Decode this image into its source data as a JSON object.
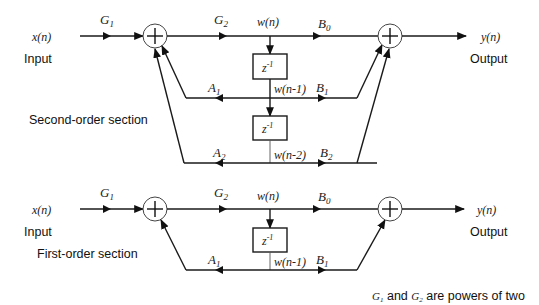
{
  "diagram": {
    "second_order": {
      "section_label": "Second-order section",
      "input_signal": "x(n)",
      "input_label": "Input",
      "output_signal": "y(n)",
      "output_label": "Output",
      "gains": {
        "g1": "G",
        "g1_sub": "1",
        "g2": "G",
        "g2_sub": "2"
      },
      "nodes": {
        "w0": "w(n)",
        "w1": "w(n-1)",
        "w2": "w(n-2)"
      },
      "delays": [
        {
          "base": "z",
          "exp": "-1"
        },
        {
          "base": "z",
          "exp": "-1"
        }
      ],
      "feedback": [
        {
          "name": "A",
          "sub": "1"
        },
        {
          "name": "A",
          "sub": "2"
        }
      ],
      "feedforward": [
        {
          "name": "B",
          "sub": "0"
        },
        {
          "name": "B",
          "sub": "1"
        },
        {
          "name": "B",
          "sub": "2"
        }
      ],
      "summers": [
        "+",
        "+"
      ]
    },
    "first_order": {
      "section_label": "First-order section",
      "input_signal": "x(n)",
      "input_label": "Input",
      "output_signal": "y(n)",
      "output_label": "Output",
      "gains": {
        "g1": "G",
        "g1_sub": "1",
        "g2": "G",
        "g2_sub": "2"
      },
      "nodes": {
        "w0": "w(n)",
        "w1": "w(n-1)"
      },
      "delays": [
        {
          "base": "z",
          "exp": "-1"
        }
      ],
      "feedback": [
        {
          "name": "A",
          "sub": "1"
        }
      ],
      "feedforward": [
        {
          "name": "B",
          "sub": "0"
        },
        {
          "name": "B",
          "sub": "1"
        }
      ],
      "summers": [
        "+",
        "+"
      ]
    },
    "footnote": {
      "g1": "G",
      "g1_sub": "1",
      "and": " and ",
      "g2": "G",
      "g2_sub": "2",
      "rest": " are powers of two"
    },
    "colors": {
      "line": "#1a1a1a",
      "text": "#111111",
      "background": "#ffffff"
    }
  }
}
